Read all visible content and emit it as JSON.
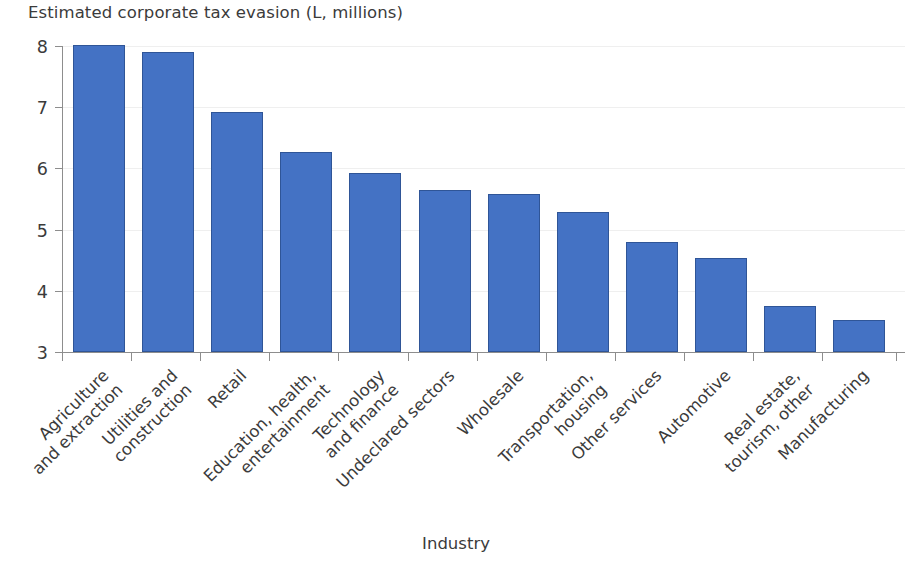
{
  "chart_data": {
    "type": "bar",
    "title": "Estimated corporate tax evasion (L, millions)",
    "xlabel": "Industry",
    "ylabel": "",
    "ylim": [
      3,
      8
    ],
    "yticks": [
      "3",
      "4",
      "5",
      "6",
      "7",
      "8"
    ],
    "grid": false,
    "legend": "none",
    "bar_color": "#4472c4",
    "bar_edge_color": "#2f5597",
    "axis_color": "#8d8d8d",
    "text_color": "#3b3b3b",
    "categories": [
      "Agriculture\nand extraction",
      "Utilities and\nconstruction",
      "Retail",
      "Education, health,\nentertainment",
      "Technology\nand finance",
      "Undeclared sectors",
      "Wholesale",
      "Transportation,\nhousing",
      "Other services",
      "Automotive",
      "Real estate,\ntourism, other",
      "Manufacturing"
    ],
    "values": [
      8.02,
      7.9,
      6.92,
      6.26,
      5.92,
      5.64,
      5.58,
      5.28,
      4.8,
      4.54,
      3.75,
      3.53
    ]
  }
}
